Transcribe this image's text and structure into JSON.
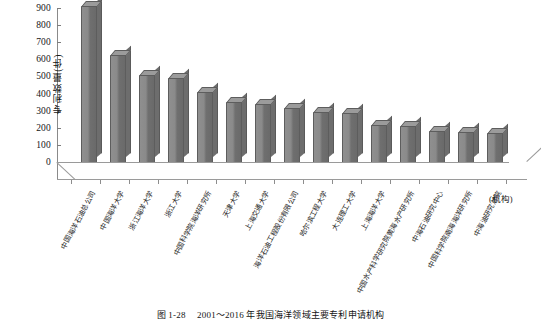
{
  "chart_data": {
    "type": "bar",
    "title": "",
    "xlabel": "(机构)",
    "ylabel": "专利数量(件)",
    "ylim": [
      0,
      900
    ],
    "ytick_step": 100,
    "yticks": [
      "900",
      "800",
      "700",
      "600",
      "500",
      "400",
      "300",
      "200",
      "100",
      "0"
    ],
    "grid": false,
    "legend": "none",
    "bar_color": "#7d7d7d",
    "categories": [
      "中国海洋石油总公司",
      "中国海洋大学",
      "浙江海洋大学",
      "浙江大学",
      "中国科学院海洋研究所",
      "天津大学",
      "上海交通大学",
      "海洋石油工程股份有限公司",
      "哈尔滨工程大学",
      "大连理工大学",
      "上海海洋大学",
      "中国水产科学研究院黄海水产研究所",
      "中海石油研究中心",
      "中国科学院南海海洋研究所",
      "中海油研究总院"
    ],
    "values": [
      910,
      625,
      510,
      490,
      410,
      350,
      340,
      315,
      290,
      288,
      215,
      212,
      180,
      178,
      170
    ]
  },
  "caption": {
    "number": "图 1-28",
    "text": "2001～2016 年我国海洋领域主要专利申请机构"
  }
}
